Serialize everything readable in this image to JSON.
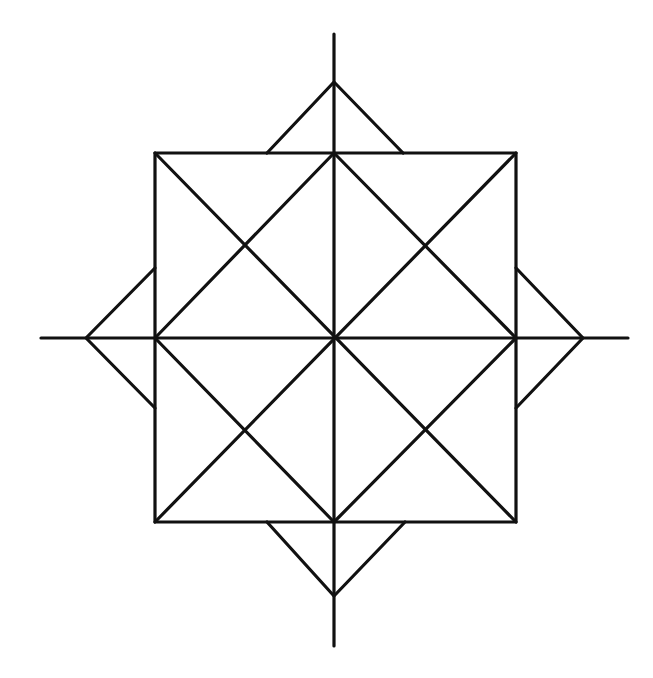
{
  "diagram": {
    "type": "geometric-figure",
    "stroke_color": "#111111",
    "background": "#ffffff",
    "center": [
      334,
      338
    ],
    "square": {
      "x1": 155,
      "y1": 153,
      "x2": 516,
      "y2": 522
    },
    "axes": {
      "vertical": {
        "x": 334,
        "y1": 34,
        "y2": 646
      },
      "horizontal": {
        "y": 338,
        "x1": 41,
        "x2": 628
      }
    },
    "points": {
      "top": {
        "apex": [
          334,
          82
        ],
        "base": [
          267,
          403
        ]
      },
      "bottom": {
        "apex": [
          334,
          596
        ],
        "base": [
          267,
          405
        ]
      },
      "left": {
        "apex": [
          86,
          338
        ],
        "base": [
          268,
          408
        ]
      },
      "right": {
        "apex": [
          583,
          338
        ],
        "base": [
          268,
          408
        ]
      }
    }
  }
}
